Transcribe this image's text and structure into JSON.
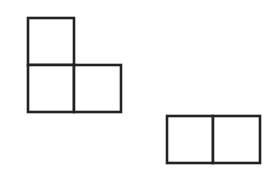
{
  "canvas": {
    "width": 277,
    "height": 171,
    "background": "#ffffff"
  },
  "style": {
    "stroke": "#222222",
    "stroke_width": 2.6,
    "fill": "#ffffff"
  },
  "shapes": [
    {
      "name": "l-shape-tromino",
      "cells": [
        {
          "x": 28,
          "y": 18,
          "w": 46,
          "h": 47
        },
        {
          "x": 28,
          "y": 65,
          "w": 46,
          "h": 47
        },
        {
          "x": 74,
          "y": 65,
          "w": 47,
          "h": 47
        }
      ]
    },
    {
      "name": "horizontal-domino",
      "cells": [
        {
          "x": 167,
          "y": 116,
          "w": 46,
          "h": 47
        },
        {
          "x": 213,
          "y": 116,
          "w": 47,
          "h": 47
        }
      ]
    }
  ]
}
